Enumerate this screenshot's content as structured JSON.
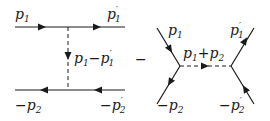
{
  "diagram_t_channel": {
    "labels": {
      "in_top": "p",
      "in_top_sub": "1",
      "out_top": "p",
      "out_top_prime": "′",
      "out_top_sub": "1",
      "propagator": "p",
      "propagator_sub1": "1",
      "propagator_op": "−",
      "propagator_p2": "p",
      "propagator_prime": "′",
      "propagator_sub2": "1",
      "in_bottom_sign": "−",
      "in_bottom": "p",
      "in_bottom_sub": "2",
      "out_bottom_sign": "−",
      "out_bottom": "p",
      "out_bottom_prime": "′",
      "out_bottom_sub": "2"
    }
  },
  "operator": "−",
  "diagram_s_channel": {
    "labels": {
      "in_top": "p",
      "in_top_sub": "1",
      "out_top": "p",
      "out_top_prime": "′",
      "out_top_sub": "1",
      "propagator": "p",
      "propagator_sub1": "1",
      "propagator_op": "+",
      "propagator_p2": "p",
      "propagator_sub2": "2",
      "in_bottom_sign": "−",
      "in_bottom": "p",
      "in_bottom_sub": "2",
      "out_bottom_sign": "−",
      "out_bottom": "p",
      "out_bottom_prime": "′",
      "out_bottom_sub": "2"
    }
  },
  "colors": {
    "line": "#1a1a1a",
    "background": "#ffffff"
  }
}
